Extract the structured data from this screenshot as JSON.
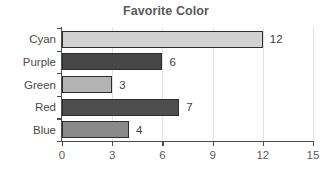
{
  "chart_data": {
    "type": "bar",
    "orientation": "horizontal",
    "title": "Favorite Color",
    "xlabel": "",
    "ylabel": "",
    "categories": [
      "Cyan",
      "Purple",
      "Green",
      "Red",
      "Blue"
    ],
    "values": [
      12,
      6,
      3,
      7,
      4
    ],
    "value_labels": [
      "12",
      "6",
      "3",
      "7",
      "4"
    ],
    "bar_colors": [
      "#d2d2d2",
      "#474747",
      "#b4b4b4",
      "#4e4e4e",
      "#8a8a8a"
    ],
    "bar_edge_color": "#2e2e2e",
    "xlim": [
      0,
      15
    ],
    "xticks": [
      0,
      3,
      6,
      9,
      12,
      15
    ],
    "xtick_labels": [
      "0",
      "3",
      "6",
      "9",
      "12",
      "15"
    ],
    "grid": true,
    "grid_axis": "x",
    "grid_color": "#e2e2e2",
    "legend": false,
    "title_color": "#5a5a5a",
    "axis_color": "#4d4d4d",
    "background": "#ffffff"
  }
}
